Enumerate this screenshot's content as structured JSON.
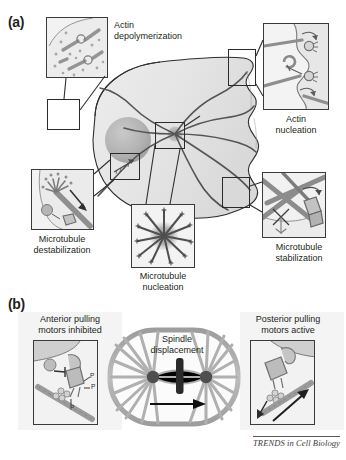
{
  "figure": {
    "credit": "TRENDS in Cell Biology",
    "panels": [
      {
        "letter": "(a)"
      },
      {
        "letter": "(b)"
      }
    ]
  },
  "panel_a": {
    "letter": "(a)",
    "captions": {
      "actin_depolymerization": {
        "line1": "Actin",
        "line2": "depolymerization"
      },
      "actin_nucleation": {
        "line1": "Actin",
        "line2": "nucleation"
      },
      "microtubule_destabilization": {
        "line1": "Microtubule",
        "line2": "destabilization"
      },
      "microtubule_nucleation": {
        "line1": "Microtubule",
        "line2": "nucleation"
      },
      "microtubule_stabilization": {
        "line1": "Microtubule",
        "line2": "stabilization"
      }
    },
    "cell": {
      "nucleus_label": "nucleus",
      "centrosome_label": "centrosome"
    }
  },
  "panel_b": {
    "letter": "(b)",
    "captions": {
      "anterior": {
        "line1": "Anterior pulling",
        "line2": "motors inhibited"
      },
      "posterior": {
        "line1": "Posterior pulling",
        "line2": "motors active"
      },
      "spindle": {
        "line1": "Spindle",
        "line2": "displacement"
      }
    },
    "annotations": {
      "phospho_1": "P",
      "phospho_2": "P",
      "phospho_3": "P"
    }
  },
  "colors": {
    "ink": "#231f20",
    "outline": "#3a3a3a",
    "inset_fill": "#f2f2f2",
    "cytoplasm": "#e9e9e9",
    "nucleus": "#b5b5b5",
    "microtubule": "#6e6e6e",
    "actin": "#8d8d8d",
    "motor": "#9a9a9a",
    "arrow": "#1a1a1a",
    "soft_bg": "#f4f4f4"
  }
}
